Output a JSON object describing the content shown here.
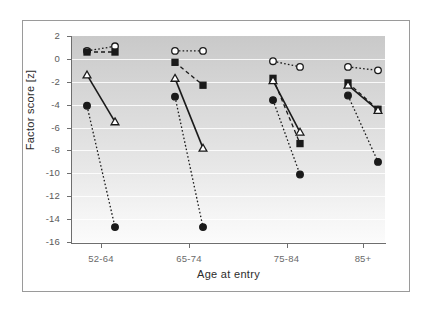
{
  "chart_data": {
    "type": "line",
    "title": "",
    "xlabel": "Age at entry",
    "ylabel": "Factor score [z]",
    "categories": [
      "52-64",
      "65-74",
      "75-84",
      "85+"
    ],
    "ylim": [
      -16,
      2
    ],
    "yticks": [
      2,
      0,
      -2,
      -4,
      -6,
      -8,
      -10,
      -12,
      -14,
      -16
    ],
    "ytick_labels": [
      "2",
      "0",
      "-2",
      "-4",
      "-6",
      "-8",
      "-10",
      "-12",
      "-14",
      "-16"
    ],
    "grid": true,
    "legend": "none",
    "x_positions_px": [
      [
        87,
        115
      ],
      [
        175,
        203
      ],
      [
        273,
        300
      ],
      [
        348,
        378
      ]
    ],
    "series": [
      {
        "name": "open-circle-dotted",
        "marker": "open-circle",
        "line_style": "dotted",
        "color": "#1a1a1a",
        "points": [
          {
            "category": "52-64",
            "start": 0.7,
            "end": 1.1
          },
          {
            "category": "65-74",
            "start": 0.7,
            "end": 0.7
          },
          {
            "category": "75-84",
            "start": -0.2,
            "end": -0.7
          },
          {
            "category": "85+",
            "start": -0.7,
            "end": -1.0
          }
        ]
      },
      {
        "name": "filled-square-dashed",
        "marker": "filled-square",
        "line_style": "dashed",
        "color": "#1a1a1a",
        "points": [
          {
            "category": "52-64",
            "start": 0.6,
            "end": 0.6
          },
          {
            "category": "65-74",
            "start": -0.3,
            "end": -2.3
          },
          {
            "category": "75-84",
            "start": -1.7,
            "end": -7.4
          },
          {
            "category": "85+",
            "start": -2.1,
            "end": -4.4
          }
        ]
      },
      {
        "name": "open-triangle-solid",
        "marker": "open-triangle",
        "line_style": "solid",
        "color": "#1a1a1a",
        "points": [
          {
            "category": "52-64",
            "start": -1.4,
            "end": -5.5
          },
          {
            "category": "65-74",
            "start": -1.7,
            "end": -7.8
          },
          {
            "category": "75-84",
            "start": -1.9,
            "end": -6.4
          },
          {
            "category": "85+",
            "start": -2.3,
            "end": -4.5
          }
        ]
      },
      {
        "name": "filled-circle-dotted",
        "marker": "filled-circle",
        "line_style": "dotted",
        "color": "#1a1a1a",
        "points": [
          {
            "category": "52-64",
            "start": -4.1,
            "end": -14.7
          },
          {
            "category": "65-74",
            "start": -3.3,
            "end": -14.7
          },
          {
            "category": "75-84",
            "start": -3.6,
            "end": -10.1
          },
          {
            "category": "85+",
            "start": -3.2,
            "end": -9.0
          }
        ]
      }
    ]
  }
}
